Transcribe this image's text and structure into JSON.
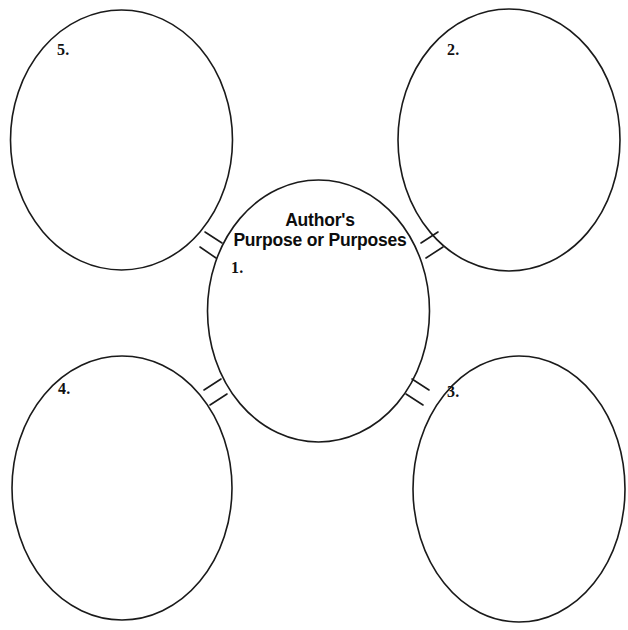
{
  "worksheet": {
    "title": "Author's Purpose or Purposes",
    "center": {
      "title_line_1": "Author's",
      "title_line_2": "Purpose or Purposes",
      "number_label": "1."
    },
    "nodes": [
      {
        "id": "node-top-left",
        "number_label": "5.",
        "position": "top-left"
      },
      {
        "id": "node-top-right",
        "number_label": "2.",
        "position": "top-right"
      },
      {
        "id": "node-bottom-right",
        "number_label": "3.",
        "position": "bottom-right"
      },
      {
        "id": "node-bottom-left",
        "number_label": "4.",
        "position": "bottom-left"
      }
    ],
    "colors": {
      "background": "#ffffff",
      "stroke": "#1a1a1a",
      "text": "#111111"
    }
  }
}
